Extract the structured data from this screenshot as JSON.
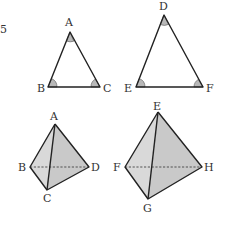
{
  "figure": {
    "corner_mark": "5",
    "triangle_abc": {
      "vertices": {
        "A": {
          "label": "A",
          "x": 70,
          "y": 32
        },
        "B": {
          "label": "B",
          "x": 48,
          "y": 87
        },
        "C": {
          "label": "C",
          "x": 100,
          "y": 87
        }
      },
      "marked_angles": [
        "A",
        "B",
        "C"
      ]
    },
    "triangle_def": {
      "vertices": {
        "D": {
          "label": "D",
          "x": 164,
          "y": 15
        },
        "E": {
          "label": "E",
          "x": 136,
          "y": 87
        },
        "F": {
          "label": "F",
          "x": 203,
          "y": 87
        }
      },
      "marked_angles": [
        "D",
        "E",
        "F"
      ]
    },
    "tetrahedron_abcd": {
      "vertices": {
        "A": {
          "label": "A"
        },
        "B": {
          "label": "B"
        },
        "C": {
          "label": "C"
        },
        "D": {
          "label": "D"
        }
      },
      "hidden_edge": "BD"
    },
    "tetrahedron_efgh": {
      "vertices": {
        "E": {
          "label": "E"
        },
        "F": {
          "label": "F"
        },
        "G": {
          "label": "G"
        },
        "H": {
          "label": "H"
        }
      },
      "hidden_edge": "FH"
    },
    "colors": {
      "line": "#222222",
      "face_fill": "#c9c9c9",
      "angle_fill": "#b8b8b8",
      "background": "#ffffff"
    }
  }
}
